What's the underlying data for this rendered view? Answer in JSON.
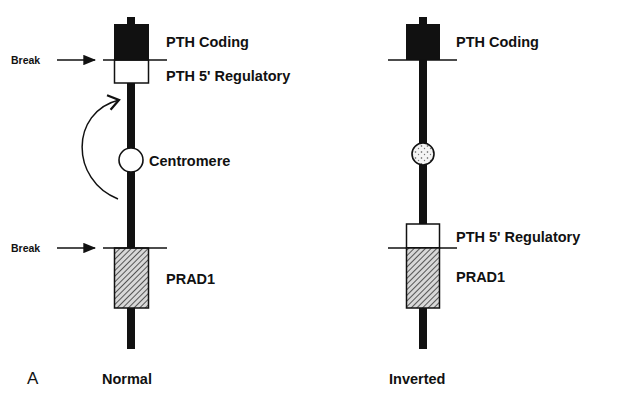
{
  "figure": {
    "panel_letter": "A",
    "colors": {
      "ink": "#111111",
      "background": "#ffffff",
      "hatch_fill": "#8a8a8a"
    },
    "normal": {
      "caption": "Normal",
      "labels": {
        "pth_coding": "PTH Coding",
        "pth_regulatory": "PTH 5' Regulatory",
        "centromere": "Centromere",
        "prad1": "PRAD1",
        "break_top": "Break",
        "break_bottom": "Break"
      }
    },
    "inverted": {
      "caption": "Inverted",
      "labels": {
        "pth_coding": "PTH Coding",
        "pth_regulatory": "PTH 5' Regulatory",
        "prad1": "PRAD1"
      }
    }
  }
}
